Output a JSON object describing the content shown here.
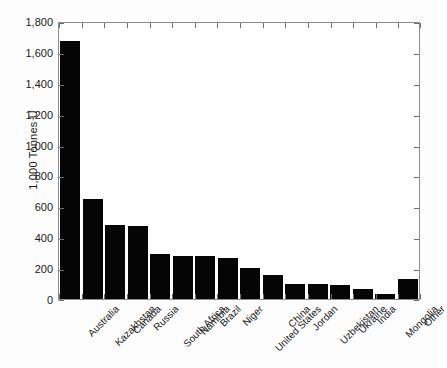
{
  "chart_data": {
    "type": "bar",
    "title": "",
    "subtitle": "",
    "xlabel": "",
    "ylabel": "1,000 Tonnes U",
    "ylim": [
      0,
      1800
    ],
    "ytick_step": 200,
    "ytick_labels": [
      "1,800",
      "1,600",
      "1,400",
      "1,200",
      "1,000",
      "800",
      "600",
      "400",
      "200",
      "0"
    ],
    "ytick_values": [
      1800,
      1600,
      1400,
      1200,
      1000,
      800,
      600,
      400,
      200,
      0
    ],
    "grid": false,
    "legend": "none",
    "bar_color": "#050505",
    "axis_color": "#8d8d8d",
    "categories": [
      "Australia",
      "Kazakhstan",
      "Canada",
      "Russia",
      "South Africa",
      "Namibia",
      "Brazil",
      "Niger",
      "United States",
      "China",
      "Jordan",
      "Uzbekistan",
      "Ukraine",
      "India",
      "Mongolia",
      "Other"
    ],
    "values": [
      1670,
      647,
      480,
      473,
      292,
      280,
      276,
      267,
      200,
      157,
      100,
      96,
      90,
      62,
      31,
      130
    ]
  }
}
